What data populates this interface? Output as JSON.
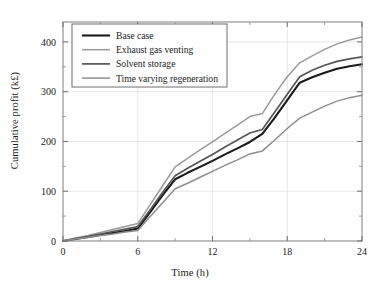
{
  "chart_data": {
    "type": "line",
    "title": "",
    "xlabel": "Time (h)",
    "ylabel": "Cumulative profit (k£)",
    "xlim": [
      0,
      24
    ],
    "ylim": [
      0,
      440
    ],
    "xticks": [
      0,
      6,
      12,
      18,
      24
    ],
    "xtick_labels": [
      "0",
      "6",
      "12",
      "18",
      "24"
    ],
    "xticks_minor": [
      3,
      9,
      15,
      21
    ],
    "yticks": [
      0,
      100,
      200,
      300,
      400
    ],
    "ytick_labels": [
      "0",
      "100",
      "200",
      "300",
      "400"
    ],
    "yticks_minor": [
      50,
      150,
      250,
      350
    ],
    "grid": true,
    "legend_position": "upper left",
    "x": [
      0,
      1,
      2,
      3,
      4,
      5,
      6,
      7,
      8,
      9,
      10,
      11,
      12,
      13,
      14,
      15,
      16,
      17,
      18,
      19,
      20,
      21,
      22,
      23,
      24
    ],
    "series": [
      {
        "name": "Base case",
        "color": "#1a1a1a",
        "width": 2.1,
        "values": [
          0,
          4,
          8,
          12,
          16,
          20,
          25,
          58,
          92,
          124,
          137,
          149,
          161,
          174,
          186,
          199,
          215,
          248,
          283,
          318,
          329,
          338,
          346,
          351,
          355
        ]
      },
      {
        "name": "Exhaust gas venting",
        "color": "#9a9a9a",
        "width": 1.5,
        "values": [
          0,
          6,
          11,
          17,
          23,
          29,
          35,
          73,
          111,
          149,
          166,
          183,
          199,
          216,
          233,
          250,
          256,
          295,
          330,
          358,
          372,
          385,
          396,
          404,
          410
        ]
      },
      {
        "name": "Solvent storage",
        "color": "#565656",
        "width": 1.7,
        "values": [
          0,
          5,
          9,
          14,
          19,
          24,
          29,
          63,
          98,
          131,
          146,
          160,
          174,
          189,
          203,
          217,
          224,
          259,
          295,
          330,
          343,
          353,
          361,
          366,
          370
        ]
      },
      {
        "name": "Time varying regeneration",
        "color": "#8d8d8d",
        "width": 1.5,
        "values": [
          0,
          4,
          7,
          11,
          14,
          18,
          21,
          49,
          77,
          105,
          116,
          128,
          140,
          152,
          163,
          175,
          181,
          203,
          226,
          247,
          259,
          271,
          281,
          288,
          293
        ]
      }
    ]
  },
  "legend": {
    "entries": [
      {
        "label": "Base case"
      },
      {
        "label": "Exhaust gas venting"
      },
      {
        "label": "Solvent storage"
      },
      {
        "label": "Time varying regeneration"
      }
    ]
  },
  "axes": {
    "xlabel": "Time (h)",
    "ylabel": "Cumulative profit (k£)",
    "xtick_labels": [
      "0",
      "6",
      "12",
      "18",
      "24"
    ],
    "ytick_labels": [
      "0",
      "100",
      "200",
      "300",
      "400"
    ]
  }
}
